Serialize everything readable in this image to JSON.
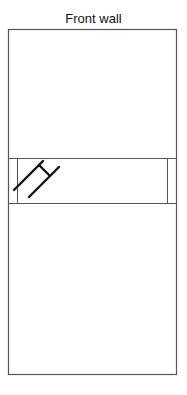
{
  "diagram": {
    "title": "Front wall",
    "stroke_color": "#555555",
    "marker_color": "#111111"
  }
}
